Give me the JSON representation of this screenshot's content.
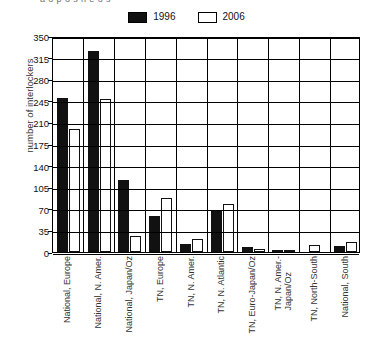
{
  "top_partial_text": "a  o  p  o  s  n  e  o  s",
  "legend": {
    "position": "top-center",
    "items": [
      {
        "label": "1996",
        "swatch": "dark",
        "color": "#111111"
      },
      {
        "label": "2006",
        "swatch": "light",
        "color": "#ffffff"
      }
    ]
  },
  "chart_data": {
    "type": "bar",
    "title": "",
    "xlabel": "",
    "ylabel": "number of interlockers",
    "ylim": [
      0,
      350
    ],
    "ytick_step": 35,
    "yticks": [
      0,
      35,
      70,
      105,
      140,
      175,
      210,
      245,
      280,
      315,
      350
    ],
    "ytick_labels": [
      "0",
      "35",
      "70",
      "105",
      "140",
      "175",
      "210",
      "245",
      "280",
      "315",
      "350"
    ],
    "grid": true,
    "grid_axis": "both",
    "legend_position": "top-center",
    "categories": [
      "National, Europe",
      "National, N. Amer.",
      "National, Japan/Oz",
      "TN, Europe",
      "TN, N. Amer.",
      "TN, N. Atlantic",
      "TN, Euro-Japan/Oz",
      "TN, N. Amer.-Japan/Oz",
      "TN, North-South",
      "National, South"
    ],
    "categories_wrapped": [
      [
        "National, Europe"
      ],
      [
        "National, N. Amer."
      ],
      [
        "National, Japan/Oz"
      ],
      [
        "TN, Europe"
      ],
      [
        "TN, N. Amer."
      ],
      [
        "TN, N. Atlantic"
      ],
      [
        "TN, Euro-Japan/Oz"
      ],
      [
        "TN, N. Amer.-",
        "Japan/Oz"
      ],
      [
        "TN, North-South"
      ],
      [
        "National, South"
      ]
    ],
    "series": [
      {
        "name": "1996",
        "color": "#111111",
        "values": [
          250,
          325,
          117,
          58,
          13,
          66,
          8,
          3,
          0,
          10
        ]
      },
      {
        "name": "2006",
        "color": "#ffffff",
        "values": [
          199,
          248,
          26,
          87,
          21,
          78,
          5,
          3,
          12,
          16
        ]
      }
    ]
  }
}
